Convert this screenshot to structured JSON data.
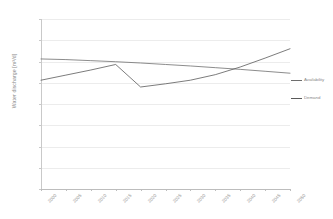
{
  "chart_data": {
    "type": "line",
    "title": "",
    "xlabel": "",
    "ylabel": "Water discharge [m³/d]",
    "ylim": [
      0,
      4000000
    ],
    "ytick_labels": [
      "4000000",
      "3500000",
      "3000000",
      "2500000",
      "2000000",
      "1500000",
      "1000000",
      "500000",
      "0"
    ],
    "ytick_values": [
      4000000,
      3500000,
      3000000,
      2500000,
      2000000,
      1500000,
      1000000,
      500000,
      0
    ],
    "grid": "horizontal",
    "legend_position": "right",
    "categories": [
      "2000",
      "2005",
      "2010",
      "2015",
      "2020",
      "2025",
      "2030",
      "2035",
      "2040",
      "2045",
      "2050"
    ],
    "series": [
      {
        "name": "Availability",
        "color": "#6e6e6e",
        "values": [
          3060000,
          3045000,
          3020000,
          2995000,
          2965000,
          2930000,
          2895000,
          2855000,
          2815000,
          2770000,
          2725000
        ]
      },
      {
        "name": "Demand",
        "color": "#5a5a5a",
        "values": [
          2560000,
          2680000,
          2800000,
          2930000,
          2400000,
          2475000,
          2560000,
          2690000,
          2870000,
          3080000,
          3300000
        ]
      }
    ]
  },
  "legend": {
    "items": [
      {
        "label": "Availability"
      },
      {
        "label": "Demand"
      }
    ]
  },
  "axis": {
    "y_title": "Water discharge [m³/d]"
  }
}
